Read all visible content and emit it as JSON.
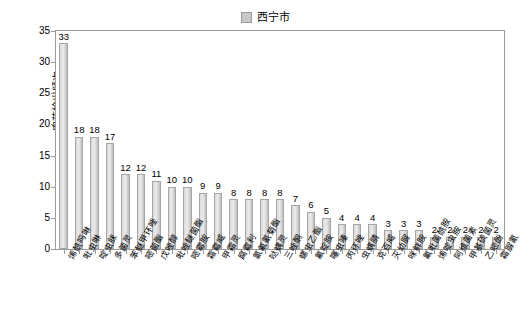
{
  "chart_data": {
    "type": "bar",
    "title": "",
    "subtitle": "",
    "xlabel": "",
    "ylabel": "农药检出频次",
    "ylim": [
      0,
      35
    ],
    "yticks": [
      0,
      5,
      10,
      15,
      20,
      25,
      30,
      35
    ],
    "grid": false,
    "legend": {
      "position": "top-center",
      "entries": [
        {
          "name": "西宁市",
          "color": "#c8c8c8"
        }
      ]
    },
    "series": [
      {
        "name": "西宁市",
        "color": "#c8c8c8",
        "values": [
          33,
          18,
          18,
          17,
          12,
          12,
          11,
          10,
          10,
          9,
          9,
          8,
          8,
          8,
          8,
          7,
          6,
          5,
          4,
          4,
          4,
          3,
          3,
          3,
          2,
          2,
          2,
          2,
          2
        ]
      }
    ],
    "categories": [
      "烯酰吗啉",
      "吡虫啉",
      "啶虫脒",
      "多菌灵",
      "苯醚甲环唑",
      "嘧菌酯",
      "戊唑醇",
      "吡唑醚菌酯",
      "嘧霉胺",
      "霜霉威",
      "甲霜灵",
      "腐霉利",
      "氯氟氰菊酯",
      "哒螨灵",
      "三唑酮",
      "螺虫乙酯",
      "氟啶胺",
      "噻虫嗪",
      "丙环唑",
      "虫螨腈",
      "克百威",
      "灭幼脲",
      "咪鲜胺",
      "氟吡菌酰胺",
      "烯啶虫胺",
      "阿维菌素",
      "甲基硫菌灵",
      "乙嘧酚",
      "霜脲氰"
    ],
    "bar_labels": [
      "33",
      "18",
      "18",
      "17",
      "12",
      "12",
      "11",
      "10",
      "10",
      "9",
      "9",
      "8",
      "8",
      "8",
      "8",
      "7",
      "6",
      "5",
      "4",
      "4",
      "4",
      "3",
      "3",
      "3",
      "2",
      "2",
      "2",
      "2",
      "2"
    ]
  }
}
